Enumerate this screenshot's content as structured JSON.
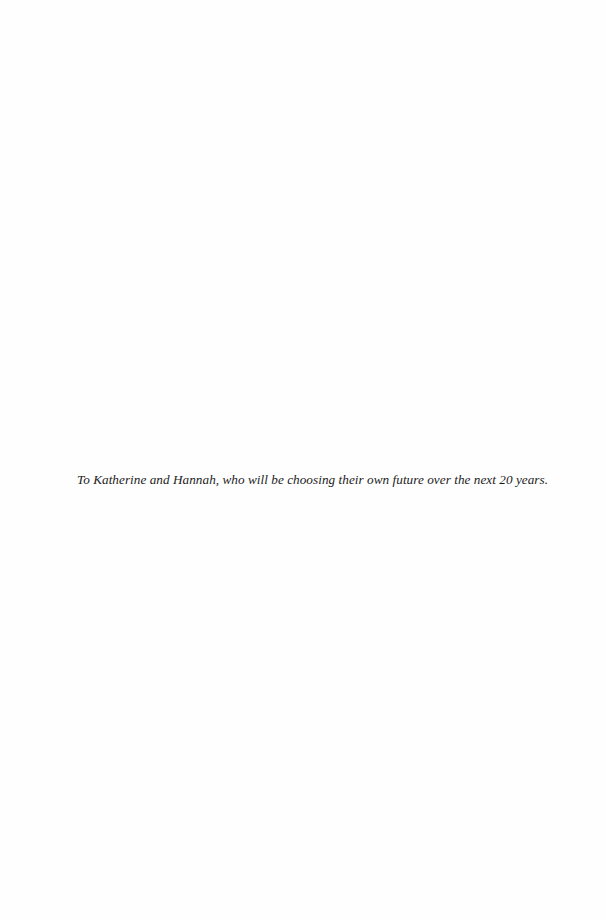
{
  "page": {
    "type": "dedication",
    "dedication_text": "To Katherine and Hannah, who will be choosing their own future over the next 20 years."
  }
}
